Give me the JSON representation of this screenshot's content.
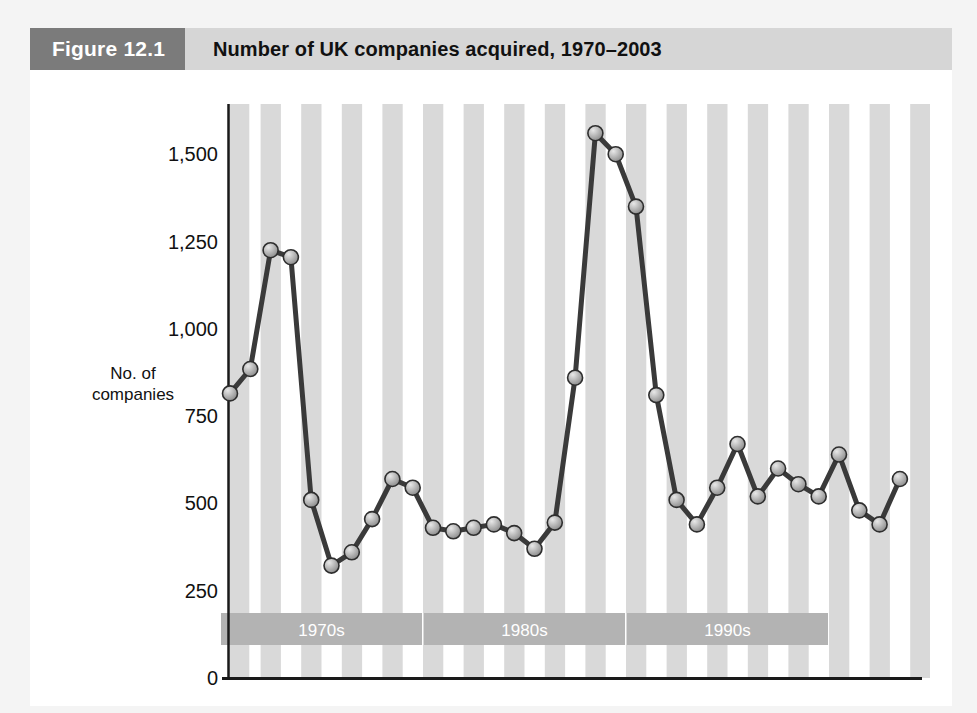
{
  "figure": {
    "number_label": "Figure 12.1",
    "title": "Number of UK companies acquired, 1970–2003"
  },
  "axis": {
    "y_label_line1": "No. of",
    "y_label_line2": "companies",
    "y_ticks": [
      "0",
      "250",
      "500",
      "750",
      "1,000",
      "1,250",
      "1,500"
    ]
  },
  "decade_bands": [
    {
      "label": "1970s",
      "start_year": 1970,
      "end_year": 1979
    },
    {
      "label": "1980s",
      "start_year": 1980,
      "end_year": 1989
    },
    {
      "label": "1990s",
      "start_year": 1990,
      "end_year": 1999
    }
  ],
  "colors": {
    "figure_number_bg": "#7b7b7b",
    "figure_title_bg": "#d6d6d6",
    "stripe": "#d9d9d9",
    "band_bg": "#b3b3b3",
    "band_text": "#ffffff",
    "line": "#3a3a3a",
    "marker_fill": "#b0b0b0",
    "marker_stroke": "#2e2e2e",
    "axis": "#1a1a1a",
    "card_bg": "#ffffff",
    "page_bg": "#f4f4f4"
  },
  "chart_data": {
    "type": "line",
    "title": "Number of UK companies acquired, 1970–2003",
    "xlabel": "",
    "ylabel": "No. of companies",
    "ylim": [
      0,
      1600
    ],
    "ytick_values": [
      0,
      250,
      500,
      750,
      1000,
      1250,
      1500
    ],
    "grid": false,
    "legend": "none",
    "x": [
      1970,
      1971,
      1972,
      1973,
      1974,
      1975,
      1976,
      1977,
      1978,
      1979,
      1980,
      1981,
      1982,
      1983,
      1984,
      1985,
      1986,
      1987,
      1988,
      1989,
      1990,
      1991,
      1992,
      1993,
      1994,
      1995,
      1996,
      1997,
      1998,
      1999,
      2000,
      2001,
      2002,
      2003
    ],
    "values": [
      815,
      885,
      1225,
      1205,
      510,
      322,
      360,
      455,
      570,
      545,
      430,
      420,
      430,
      440,
      415,
      370,
      445,
      860,
      1560,
      1500,
      1350,
      810,
      510,
      440,
      545,
      670,
      520,
      600,
      555,
      520,
      640,
      480,
      440,
      570
    ],
    "annotations": [
      {
        "text": "1970s",
        "type": "decade-band"
      },
      {
        "text": "1980s",
        "type": "decade-band"
      },
      {
        "text": "1990s",
        "type": "decade-band"
      }
    ]
  }
}
